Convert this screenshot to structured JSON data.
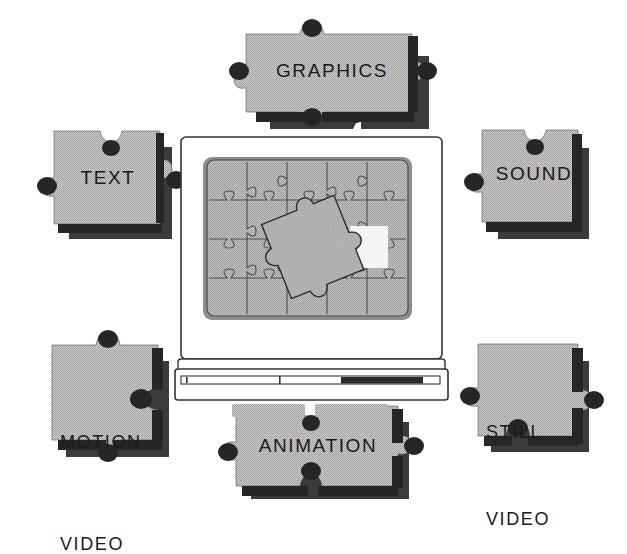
{
  "diagram": {
    "background_color": "#ffffff",
    "piece_fill": "#b9b9b9",
    "piece_fill_light": "#c9c9c9",
    "piece_shadow": "#2b2b2b",
    "knob_dark": "#262626",
    "outline": "#1a1a1a",
    "screen_fill": "#b4b4b4",
    "screen_gap_fill": "#f2f2f2",
    "monitor_body": "#ffffff"
  },
  "pieces": [
    {
      "id": "graphics",
      "label": "GRAPHICS",
      "position": "top-center",
      "tabs": {
        "top": "tab",
        "right": "tab",
        "bottom": "tab",
        "left": "socket"
      }
    },
    {
      "id": "text",
      "label": "TEXT",
      "position": "left-upper",
      "tabs": {
        "top": "socket",
        "right": "tab",
        "bottom": "flat",
        "left": "socket"
      }
    },
    {
      "id": "sound",
      "label": "SOUND",
      "position": "right-upper",
      "tabs": {
        "top": "socket",
        "right": "flat",
        "bottom": "flat",
        "left": "socket"
      }
    },
    {
      "id": "motion-video",
      "label": "MOTION\nVIDEO",
      "line1": "MOTION",
      "line2": "VIDEO",
      "position": "left-lower",
      "tabs": {
        "top": "tab",
        "right": "socket",
        "bottom": "tab",
        "left": "flat"
      }
    },
    {
      "id": "still-video",
      "label": "STILL\nVIDEO",
      "line1": "STILL",
      "line2": "VIDEO",
      "position": "right-lower",
      "tabs": {
        "top": "flat",
        "right": "tab",
        "bottom": "socket",
        "left": "socket"
      }
    },
    {
      "id": "animation",
      "label": "ANIMATION",
      "position": "bottom-center",
      "tabs": {
        "top": "socket",
        "right": "tab",
        "bottom": "tab",
        "left": "socket"
      }
    }
  ],
  "monitor": {
    "name": "computer-monitor",
    "screen": {
      "name": "monitor-screen",
      "puzzle": {
        "columns": 5,
        "rows": 4,
        "loose_piece": true,
        "gap_visible": true
      }
    },
    "base": {
      "name": "monitor-base",
      "slot_label": "",
      "drive_slot": true
    },
    "feet": 2
  },
  "icons": {
    "puzzle": "puzzle-piece-icon",
    "monitor": "monitor-icon",
    "screen": "screen-icon"
  }
}
